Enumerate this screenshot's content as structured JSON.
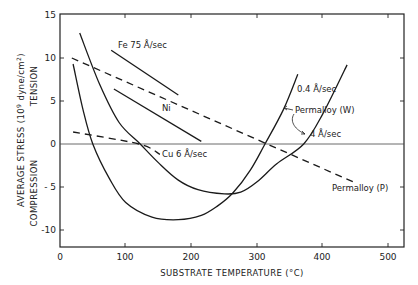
{
  "chart_data": {
    "type": "line",
    "title": "",
    "xlabel": "SUBSTRATE TEMPERATURE (°C)",
    "ylabel": "AVERAGE STRESS (10⁹ dyne/cm²)",
    "ylabel_upper": "TENSION",
    "ylabel_lower": "COMPRESSION",
    "xlim": [
      0,
      523
    ],
    "ylim": [
      -12,
      15
    ],
    "xticks": [
      0,
      100,
      200,
      300,
      400,
      500
    ],
    "yticks": [
      15,
      10,
      5,
      0,
      -5,
      -10
    ],
    "grid": false,
    "legend": "inline annotations",
    "series": [
      {
        "name": "Permalloy (W) 0.4 Å/sec",
        "style": "solid",
        "x": [
          20,
          35,
          50,
          75,
          100,
          140,
          180,
          215,
          240,
          263,
          290,
          312,
          340,
          362
        ],
        "y": [
          9.3,
          4.0,
          0.0,
          -4.0,
          -6.8,
          -8.5,
          -8.8,
          -8.3,
          -7.2,
          -5.7,
          -3.0,
          0.0,
          4.0,
          8.1
        ]
      },
      {
        "name": "Permalloy (W) 4 Å/sec",
        "style": "solid",
        "x": [
          30,
          60,
          90,
          122,
          150,
          180,
          210,
          250,
          275,
          300,
          330,
          371,
          400,
          437
        ],
        "y": [
          12.9,
          7.0,
          2.5,
          0.0,
          -2.2,
          -4.2,
          -5.3,
          -5.8,
          -5.6,
          -4.4,
          -2.3,
          0.0,
          3.5,
          9.2
        ]
      },
      {
        "name": "Fe 75 Å/sec",
        "style": "solid",
        "x": [
          78,
          180
        ],
        "y": [
          10.9,
          5.7
        ]
      },
      {
        "name": "Ni",
        "style": "solid",
        "x": [
          82,
          215
        ],
        "y": [
          6.4,
          0.3
        ]
      },
      {
        "name": "Permalloy (P)",
        "style": "dashed",
        "x": [
          18,
          449
        ],
        "y": [
          10.0,
          -4.5
        ]
      },
      {
        "name": "Cu 6 Å/sec",
        "style": "dashed",
        "x": [
          20,
          120,
          152
        ],
        "y": [
          1.4,
          0.0,
          -1.2
        ]
      }
    ],
    "annotations": [
      {
        "text": "Fe 75 Å/sec",
        "x": 95,
        "y": 11.2
      },
      {
        "text": "Ni",
        "x": 150,
        "y": 4.6
      },
      {
        "text": "Cu 6 Å/sec",
        "x": 125,
        "y": -1.2
      },
      {
        "text": "0.4 Å/sec",
        "x": 360,
        "y": 6.3
      },
      {
        "text": "Permalloy (W)",
        "x": 347,
        "y": 3.2
      },
      {
        "text": "4 Å/sec",
        "x": 382,
        "y": 0.6
      },
      {
        "text": "Permalloy (P)",
        "x": 365,
        "y": -6.4
      }
    ]
  },
  "axes": {
    "x_title": "SUBSTRATE TEMPERATURE (°C)",
    "y_title_main": "AVERAGE  STRESS (10",
    "y_title_exp": "9",
    "y_title_unit": " dyne/cm",
    "y_title_unit_exp": "2",
    "y_title_close": ")",
    "y_upper": "TENSION",
    "y_lower": "COMPRESSION",
    "x_ticks": [
      "0",
      "100",
      "200",
      "300",
      "400",
      "500"
    ],
    "y_ticks": [
      "15",
      "10",
      "5",
      "0",
      "- 5",
      "-10"
    ]
  },
  "labels": {
    "fe": "Fe  75 Å/sec",
    "ni": "Ni",
    "cu": "Cu 6 Å/sec",
    "w_slow": "0.4 Å/sec",
    "w_name": "Permalloy (W)",
    "w_fast": "4 Å/sec",
    "p_name": "Permalloy (P)"
  }
}
